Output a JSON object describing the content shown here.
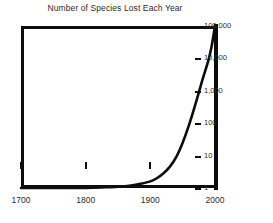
{
  "chart_data": {
    "type": "line",
    "title": "Number of Species Lost Each Year",
    "xlabel": "",
    "ylabel": "",
    "xlim": [
      1700,
      2000
    ],
    "ylim": [
      1,
      100000
    ],
    "yscale": "log",
    "xscale": "linear",
    "grid": false,
    "legend": null,
    "xticks": [
      {
        "value": 1700,
        "label": "1700"
      },
      {
        "value": 1800,
        "label": "1800"
      },
      {
        "value": 1900,
        "label": "1900"
      },
      {
        "value": 2000,
        "label": "2000"
      }
    ],
    "yticks": [
      {
        "value": 1,
        "label": "1"
      },
      {
        "value": 10,
        "label": "10"
      },
      {
        "value": 100,
        "label": "100"
      },
      {
        "value": 1000,
        "label": "1,000"
      },
      {
        "value": 10000,
        "label": "10,000"
      },
      {
        "value": 100000,
        "label": "100,000"
      }
    ],
    "series": [
      {
        "name": "Species lost per year",
        "color": "#0d0d0d",
        "x": [
          1700,
          1750,
          1800,
          1830,
          1850,
          1870,
          1885,
          1900,
          1910,
          1920,
          1930,
          1940,
          1950,
          1960,
          1970,
          1980,
          1990,
          1995,
          2000
        ],
        "values": [
          1,
          1,
          1,
          1.05,
          1.1,
          1.2,
          1.35,
          1.6,
          2,
          2.8,
          4.5,
          9,
          25,
          90,
          400,
          2000,
          9000,
          25000,
          100000
        ]
      }
    ]
  },
  "figure": {
    "background_color": "#ffffff",
    "axis_color": "#0d0d0d",
    "text_color": "#2b2b2b"
  }
}
